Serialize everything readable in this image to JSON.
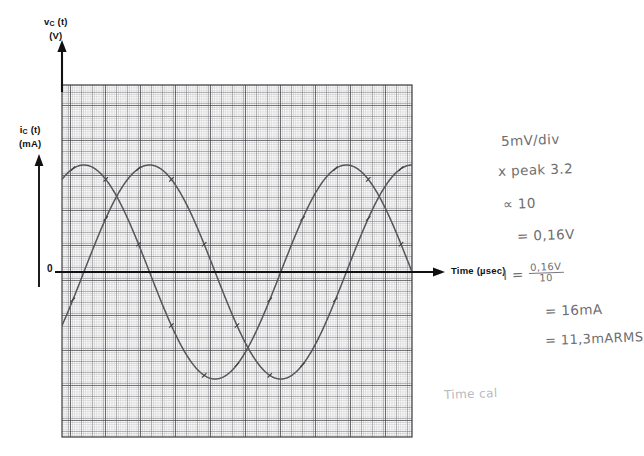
{
  "figure": {
    "kind": "hand-annotated oscilloscope graph on graph paper",
    "background_color": "#ffffff",
    "grid_color": "#9a9a9d",
    "grid_major_color": "#4a4a4d",
    "axis_color": "#111111",
    "trace_color": "#4e4e52",
    "handwriting_color": "#6d6d70"
  },
  "axes": {
    "y_left_top": {
      "symbol": "v",
      "subscript": "C",
      "arg": "(t)",
      "unit": "(V)"
    },
    "y_left_lower": {
      "symbol": "i",
      "subscript": "C",
      "arg": "(t)",
      "unit": "(mA)"
    },
    "x_axis": {
      "label": "Time (µsec)"
    },
    "origin_tick": "0"
  },
  "notes": {
    "lines": [
      {
        "id": "note-volts-per-div",
        "text": "5mV/div"
      },
      {
        "id": "note-peak",
        "text": "x peak  3.2"
      },
      {
        "id": "note-times-ten",
        "text": "∝ 10"
      },
      {
        "id": "note-result-volts",
        "text": "= 0,16V"
      },
      {
        "id": "note-current-result",
        "text": "= 16mA"
      },
      {
        "id": "note-current-rms",
        "text": "= 11,3mARMS"
      }
    ],
    "current_equation": {
      "lead": "I =",
      "numerator": "0,16V",
      "denominator": "10"
    },
    "footer_note": "Time cal"
  },
  "chart_data": {
    "type": "line",
    "title": "",
    "xlabel": "Time (µsec)",
    "ylabel": "v_C (t) (V) / i_C (t) (mA)",
    "grid": true,
    "grid_minor_px": 2.19,
    "grid_major_every": 5,
    "legend": "none",
    "xlim": [
      0,
      16
    ],
    "ylim": [
      -4.4,
      4.6
    ],
    "zero_line_y": 0,
    "series": [
      {
        "name": "v_C(t)",
        "comment": "voltage sinusoid, leads; peaks near t=1.0 and t=13.0 divisions",
        "amplitude": 3.2,
        "period_div": 12.0,
        "phase_div": 1.0,
        "offset": 0.0,
        "x": [
          0.0,
          0.5,
          1.0,
          1.5,
          2.0,
          2.5,
          3.0,
          3.5,
          4.0,
          4.5,
          5.0,
          5.5,
          6.0,
          6.5,
          7.0,
          7.5,
          8.0,
          8.5,
          9.0,
          9.5,
          10.0,
          10.5,
          11.0,
          11.5,
          12.0,
          12.5,
          13.0,
          13.5,
          14.0,
          14.5,
          15.0,
          15.5,
          16.0
        ],
        "y": [
          2.77,
          3.09,
          3.2,
          3.09,
          2.77,
          2.26,
          1.6,
          0.83,
          0.0,
          -0.83,
          -1.6,
          -2.26,
          -2.77,
          -3.09,
          -3.2,
          -3.09,
          -2.77,
          -2.26,
          -1.6,
          -0.83,
          0.0,
          0.83,
          1.6,
          2.26,
          2.77,
          3.09,
          3.2,
          3.09,
          2.77,
          2.26,
          1.6,
          0.83,
          0.0
        ]
      },
      {
        "name": "i_C(t)",
        "comment": "current sinusoid, lags v_C by ~3 divisions (90 degrees); peaks near t=4.0 and t=16.0",
        "amplitude": 3.2,
        "period_div": 12.0,
        "phase_div": 4.0,
        "offset": 0.0,
        "x": [
          0.0,
          0.5,
          1.0,
          1.5,
          2.0,
          2.5,
          3.0,
          3.5,
          4.0,
          4.5,
          5.0,
          5.5,
          6.0,
          6.5,
          7.0,
          7.5,
          8.0,
          8.5,
          9.0,
          9.5,
          10.0,
          10.5,
          11.0,
          11.5,
          12.0,
          12.5,
          13.0,
          13.5,
          14.0,
          14.5,
          15.0,
          15.5,
          16.0
        ],
        "y": [
          -1.6,
          -0.83,
          0.0,
          0.83,
          1.6,
          2.26,
          2.77,
          3.09,
          3.2,
          3.09,
          2.77,
          2.26,
          1.6,
          0.83,
          0.0,
          -0.83,
          -1.6,
          -2.26,
          -2.77,
          -3.09,
          -3.2,
          -3.09,
          -2.77,
          -2.26,
          -1.6,
          -0.83,
          0.0,
          0.83,
          1.6,
          2.26,
          2.77,
          3.09,
          3.2
        ]
      }
    ]
  }
}
